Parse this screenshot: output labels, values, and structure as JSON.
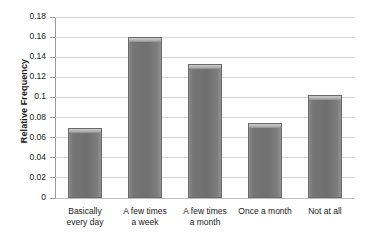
{
  "chart_data": {
    "type": "bar",
    "title": "",
    "xlabel": "",
    "ylabel": "Relative Frequency",
    "categories": [
      "Basically\never3y day",
      "A few times\na week",
      "A few times\na month",
      "Once a month",
      "Not at all"
    ],
    "values": [
      0.07,
      0.16,
      0.133,
      0.075,
      0.102
    ],
    "ylim": [
      0,
      0.18
    ],
    "yticks": [
      0,
      0.02,
      0.04,
      0.06,
      0.08,
      0.1,
      0.12,
      0.14,
      0.16,
      0.18
    ],
    "ytick_labels": [
      "0",
      "0.02",
      "0.04",
      "0.06",
      "0.08",
      "0.1",
      "0.12",
      "0.14",
      "0.16",
      "0.18"
    ],
    "grid": true,
    "legend": null,
    "bar_color": "#757575",
    "grid_color": "#d4d4d4",
    "axis_color": "#9a9a9a"
  },
  "axes": {
    "y_title": "Relative Frequency"
  },
  "categories": [
    {
      "line1": "Basically",
      "line2": "every day"
    },
    {
      "line1": "A few times",
      "line2": "a week"
    },
    {
      "line1": "A few times",
      "line2": "a month"
    },
    {
      "line1": "Once a month",
      "line2": ""
    },
    {
      "line1": "Not at all",
      "line2": ""
    }
  ],
  "ytick_labels": [
    "0.18",
    "0.16",
    "0.14",
    "0.12",
    "0.1",
    "0.08",
    "0.06",
    "0.04",
    "0.02",
    "0"
  ]
}
